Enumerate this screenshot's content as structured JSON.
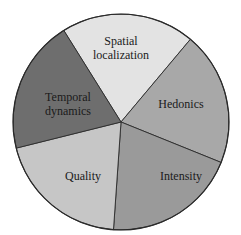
{
  "chart_data": {
    "type": "pie",
    "title": "",
    "categories": [
      "Spatial localization",
      "Hedonics",
      "Intensity",
      "Quality",
      "Temporal dynamics"
    ],
    "values": [
      20,
      20,
      20,
      20,
      20
    ],
    "colors": [
      "#e3e3e3",
      "#a8a8a8",
      "#9a9a9a",
      "#c6c6c6",
      "#6e6e6e"
    ],
    "label_lines": [
      [
        "Spatial",
        "localization"
      ],
      [
        "Hedonics"
      ],
      [
        "Intensity"
      ],
      [
        "Quality"
      ],
      [
        "Temporal",
        "dynamics"
      ]
    ],
    "start_angle_deg": -122,
    "legend": "none",
    "edge_color": "#2a2a2a"
  }
}
